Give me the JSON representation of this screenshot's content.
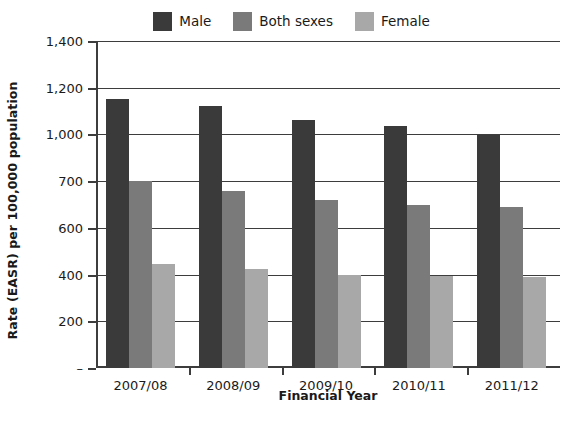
{
  "chart_data": {
    "type": "bar",
    "title": "",
    "subtitle": "",
    "xlabel": "Financial Year",
    "ylabel": "Rate (EASR) per 100,000 population",
    "categories": [
      "2007/08",
      "2008/09",
      "2009/10",
      "2010/11",
      "2011/12"
    ],
    "series": [
      {
        "name": "Male",
        "color": "#3a3a3a",
        "values": [
          1150,
          1120,
          1060,
          1035,
          995
        ]
      },
      {
        "name": "Both sexes",
        "color": "#7a7a7a",
        "values": [
          700,
          680,
          660,
          650,
          645
        ]
      },
      {
        "name": "Female",
        "color": "#a8a8a8",
        "values": [
          445,
          425,
          400,
          393,
          390
        ]
      }
    ],
    "y_tick_labels": [
      "1,400",
      "1,200",
      "1,000",
      "700",
      "600",
      "400",
      "200",
      "–"
    ],
    "y_tick_values": [
      1400,
      1200,
      1000,
      700,
      600,
      400,
      200,
      0
    ],
    "ylim": [
      0,
      1400
    ],
    "grid": "horizontal",
    "legend_position": "top-center",
    "legend_entries": [
      "Male",
      "Both sexes",
      "Female"
    ],
    "annotations": []
  },
  "legend": {
    "items": [
      {
        "label": "Male",
        "swatch": "legend-swatch-male"
      },
      {
        "label": "Both sexes",
        "swatch": "legend-swatch-both-sexes"
      },
      {
        "label": "Female",
        "swatch": "legend-swatch-female"
      }
    ]
  },
  "axes": {
    "y_title": "Rate (EASR) per 100,000 population",
    "x_title": "Financial Year"
  }
}
